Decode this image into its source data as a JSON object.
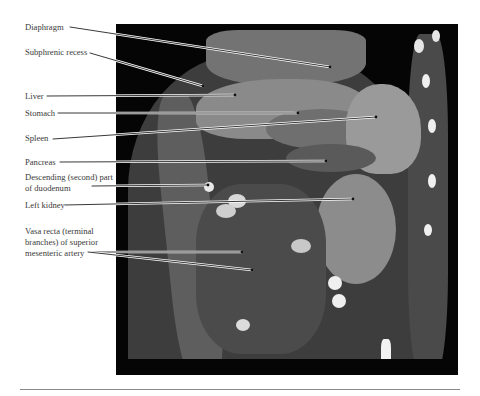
{
  "figure": {
    "type": "Coronal CT scan of abdomen (contrast enhanced)",
    "image_bounds": {
      "x": 116,
      "y": 24,
      "width": 342,
      "height": 351
    },
    "background_color": "#ffffff",
    "image_background": "#050505",
    "label_color": "#3a3a3a",
    "leader_line_color": "#222222"
  },
  "labels": [
    {
      "id": "diaphragm",
      "text": "Diaphragm",
      "x": 25,
      "y": 22,
      "line": [
        [
          70,
          27
        ],
        [
          330,
          67
        ]
      ]
    },
    {
      "id": "subphrenic-recess",
      "text": "Subphrenic recess",
      "x": 25,
      "y": 47,
      "line": [
        [
          90,
          53
        ],
        [
          203,
          86
        ]
      ]
    },
    {
      "id": "liver",
      "text": "Liver",
      "x": 25,
      "y": 91,
      "line": [
        [
          47,
          96
        ],
        [
          235,
          95
        ]
      ]
    },
    {
      "id": "stomach",
      "text": "Stomach",
      "x": 25,
      "y": 108,
      "line": [
        [
          58,
          113
        ],
        [
          298,
          113
        ]
      ]
    },
    {
      "id": "spleen",
      "text": "Spleen",
      "x": 25,
      "y": 133,
      "line": [
        [
          53,
          139
        ],
        [
          376,
          117
        ]
      ]
    },
    {
      "id": "pancreas",
      "text": "Pancreas",
      "x": 25,
      "y": 157,
      "line": [
        [
          60,
          162
        ],
        [
          326,
          161
        ]
      ]
    },
    {
      "id": "duodenum",
      "text": "Descending (second) part of duodenum",
      "x": 25,
      "y": 172,
      "line": [
        [
          92,
          186
        ],
        [
          208,
          185
        ]
      ]
    },
    {
      "id": "left-kidney",
      "text": "Left kidney",
      "x": 25,
      "y": 200,
      "line": [
        [
          65,
          205
        ],
        [
          353,
          199
        ]
      ]
    },
    {
      "id": "vasa-recta",
      "text": "Vasa recta (terminal branches) of superior mesenteric artery",
      "x": 25,
      "y": 226,
      "line": [
        [
          88,
          252
        ],
        [
          242,
          252
        ]
      ],
      "line2": [
        [
          88,
          252
        ],
        [
          252,
          270
        ]
      ]
    }
  ]
}
